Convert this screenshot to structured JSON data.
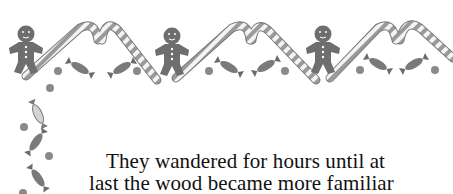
{
  "page": {
    "background": "#ffffff",
    "border": {
      "style": "grayscale watercolor holiday border",
      "motifs": [
        "candy-cane",
        "gingerbread-man",
        "wrapped-candy",
        "gumdrop"
      ],
      "top_gingerbread_count": 3,
      "colors": {
        "gingerbread": "#6e6e6e",
        "candy_dark": "#7a7a7a",
        "candy_light": "#cfcfcf",
        "cane_stripe": "#9a9a9a",
        "gumdrop": "#8a8a8a"
      }
    },
    "story_text": {
      "lines": [
        "They wandered for hours until at",
        "last the wood became more familiar"
      ]
    }
  }
}
